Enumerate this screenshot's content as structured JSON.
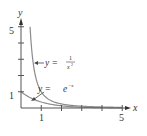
{
  "chart_data": {
    "type": "line",
    "title": "",
    "xlabel": "x",
    "ylabel": "y",
    "xlim": [
      0,
      5.1
    ],
    "ylim": [
      0,
      5.2
    ],
    "x_ticks": [
      1,
      2,
      3,
      4,
      5
    ],
    "x_tick_labels": [
      "1",
      "5"
    ],
    "y_ticks": [
      1,
      2,
      3,
      4,
      5
    ],
    "y_tick_labels": [
      "1",
      "5"
    ],
    "grid": false,
    "legend": "none (inline annotations with arrows)",
    "series": [
      {
        "name": "y = 1/x^2",
        "function": "1/x^2",
        "x_range": [
          0.447,
          5
        ],
        "points": [
          [
            0.45,
            4.94
          ],
          [
            0.5,
            4.0
          ],
          [
            0.75,
            1.78
          ],
          [
            1,
            1.0
          ],
          [
            1.5,
            0.44
          ],
          [
            2,
            0.25
          ],
          [
            3,
            0.11
          ],
          [
            4,
            0.06
          ],
          [
            5,
            0.04
          ]
        ]
      },
      {
        "name": "y = e^-x",
        "function": "exp(-x)",
        "x_range": [
          0,
          5
        ],
        "points": [
          [
            0,
            1.0
          ],
          [
            0.5,
            0.61
          ],
          [
            1,
            0.37
          ],
          [
            1.5,
            0.22
          ],
          [
            2,
            0.14
          ],
          [
            3,
            0.05
          ],
          [
            4,
            0.02
          ],
          [
            5,
            0.01
          ]
        ]
      }
    ],
    "annotations": [
      {
        "text": "y = 1/x²",
        "arrow_to": "1/x^2 curve near x≈0.65"
      },
      {
        "text": "y = e⁻ˣ",
        "arrow_to": "e^-x curve near x≈0.4"
      }
    ],
    "colors": {
      "curves": "#8c8c8c",
      "axes": "#555555",
      "text": "#333333"
    }
  },
  "labels": {
    "x_axis": "x",
    "y_axis": "y",
    "y_tick_5": "5",
    "y_tick_1": "1",
    "x_tick_1": "1",
    "x_tick_5": "5",
    "ann1_prefix": "y =",
    "ann1_num": "1",
    "ann1_den": "x",
    "ann1_exp": "2",
    "ann2_prefix": "y =",
    "ann2_base": "e",
    "ann2_exp": "−x"
  }
}
